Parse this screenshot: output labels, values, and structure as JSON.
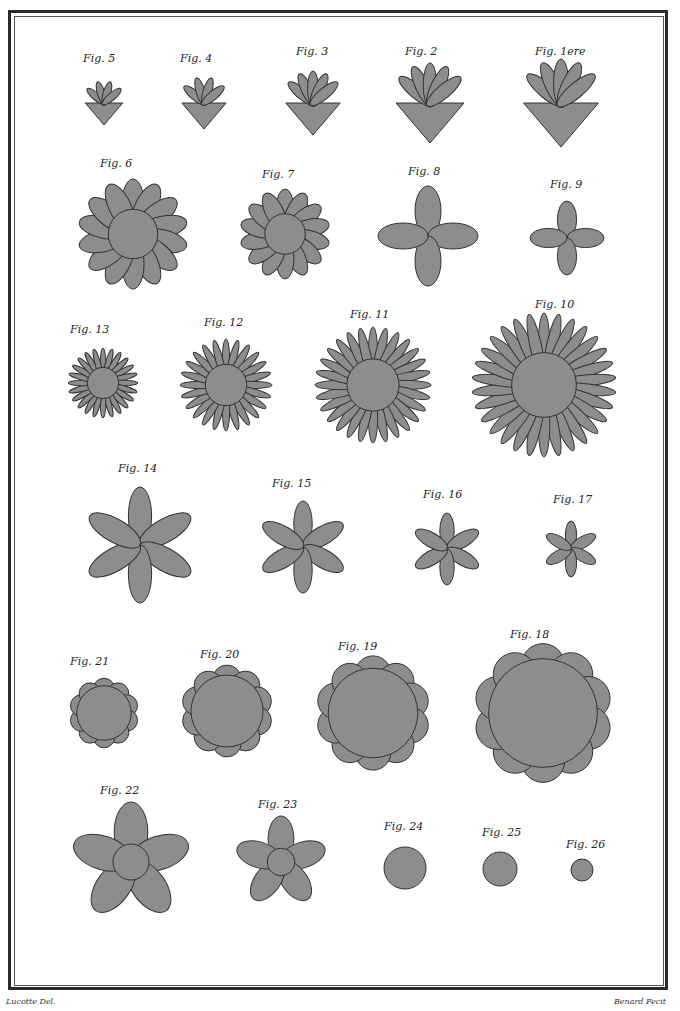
{
  "plate": {
    "credit_left": "Lucotte Del.",
    "credit_right": "Benard Fecit"
  },
  "figures": [
    {
      "label": "Fig. 5",
      "x": 83,
      "y": 52,
      "shape": "leaf",
      "cx": 104,
      "cy": 103,
      "r": 22,
      "n": 4
    },
    {
      "label": "Fig. 4",
      "x": 180,
      "y": 52,
      "shape": "leaf",
      "cx": 204,
      "cy": 103,
      "r": 26,
      "n": 4
    },
    {
      "label": "Fig. 3",
      "x": 296,
      "y": 45,
      "shape": "leaf",
      "cx": 313,
      "cy": 103,
      "r": 32,
      "n": 5
    },
    {
      "label": "Fig. 2",
      "x": 405,
      "y": 45,
      "shape": "leaf",
      "cx": 430,
      "cy": 103,
      "r": 40,
      "n": 5
    },
    {
      "label": "Fig. 1ere",
      "x": 535,
      "y": 45,
      "shape": "leaf",
      "cx": 561,
      "cy": 103,
      "r": 44,
      "n": 5
    },
    {
      "label": "Fig. 6",
      "x": 100,
      "y": 157,
      "shape": "flower",
      "cx": 133,
      "cy": 234,
      "r": 55,
      "n": 14,
      "petal": 12
    },
    {
      "label": "Fig. 7",
      "x": 262,
      "y": 168,
      "shape": "flower",
      "cx": 285,
      "cy": 234,
      "r": 45,
      "n": 14,
      "petal": 10
    },
    {
      "label": "Fig. 8",
      "x": 408,
      "y": 165,
      "shape": "cross",
      "cx": 428,
      "cy": 236,
      "r": 50
    },
    {
      "label": "Fig. 9",
      "x": 550,
      "y": 178,
      "shape": "cross",
      "cx": 567,
      "cy": 238,
      "r": 37
    },
    {
      "label": "Fig. 13",
      "x": 70,
      "y": 323,
      "shape": "star",
      "cx": 103,
      "cy": 383,
      "r": 35,
      "n": 24
    },
    {
      "label": "Fig. 12",
      "x": 204,
      "y": 316,
      "shape": "star",
      "cx": 226,
      "cy": 385,
      "r": 46,
      "n": 24
    },
    {
      "label": "Fig. 11",
      "x": 350,
      "y": 308,
      "shape": "star",
      "cx": 373,
      "cy": 385,
      "r": 58,
      "n": 28
    },
    {
      "label": "Fig. 10",
      "x": 535,
      "y": 298,
      "shape": "star",
      "cx": 544,
      "cy": 385,
      "r": 72,
      "n": 30
    },
    {
      "label": "Fig. 14",
      "x": 118,
      "y": 462,
      "shape": "six",
      "cx": 140,
      "cy": 545,
      "r": 58
    },
    {
      "label": "Fig. 15",
      "x": 272,
      "y": 477,
      "shape": "six",
      "cx": 303,
      "cy": 547,
      "r": 46
    },
    {
      "label": "Fig. 16",
      "x": 423,
      "y": 488,
      "shape": "six",
      "cx": 447,
      "cy": 549,
      "r": 36
    },
    {
      "label": "Fig. 17",
      "x": 553,
      "y": 493,
      "shape": "six",
      "cx": 571,
      "cy": 549,
      "r": 28
    },
    {
      "label": "Fig. 21",
      "x": 70,
      "y": 655,
      "shape": "round",
      "cx": 104,
      "cy": 713,
      "r": 34
    },
    {
      "label": "Fig. 20",
      "x": 200,
      "y": 648,
      "shape": "round",
      "cx": 227,
      "cy": 711,
      "r": 45
    },
    {
      "label": "Fig. 19",
      "x": 338,
      "y": 640,
      "shape": "round",
      "cx": 373,
      "cy": 713,
      "r": 56
    },
    {
      "label": "Fig. 18",
      "x": 510,
      "y": 628,
      "shape": "round",
      "cx": 543,
      "cy": 713,
      "r": 68
    },
    {
      "label": "Fig. 22",
      "x": 100,
      "y": 784,
      "shape": "five",
      "cx": 131,
      "cy": 862,
      "r": 60
    },
    {
      "label": "Fig. 23",
      "x": 258,
      "y": 798,
      "shape": "five",
      "cx": 281,
      "cy": 862,
      "r": 46
    },
    {
      "label": "Fig. 24",
      "x": 384,
      "y": 820,
      "shape": "disc",
      "cx": 405,
      "cy": 868,
      "r": 21
    },
    {
      "label": "Fig. 25",
      "x": 482,
      "y": 826,
      "shape": "disc",
      "cx": 500,
      "cy": 869,
      "r": 17
    },
    {
      "label": "Fig. 26",
      "x": 566,
      "y": 838,
      "shape": "disc",
      "cx": 582,
      "cy": 870,
      "r": 11
    }
  ]
}
